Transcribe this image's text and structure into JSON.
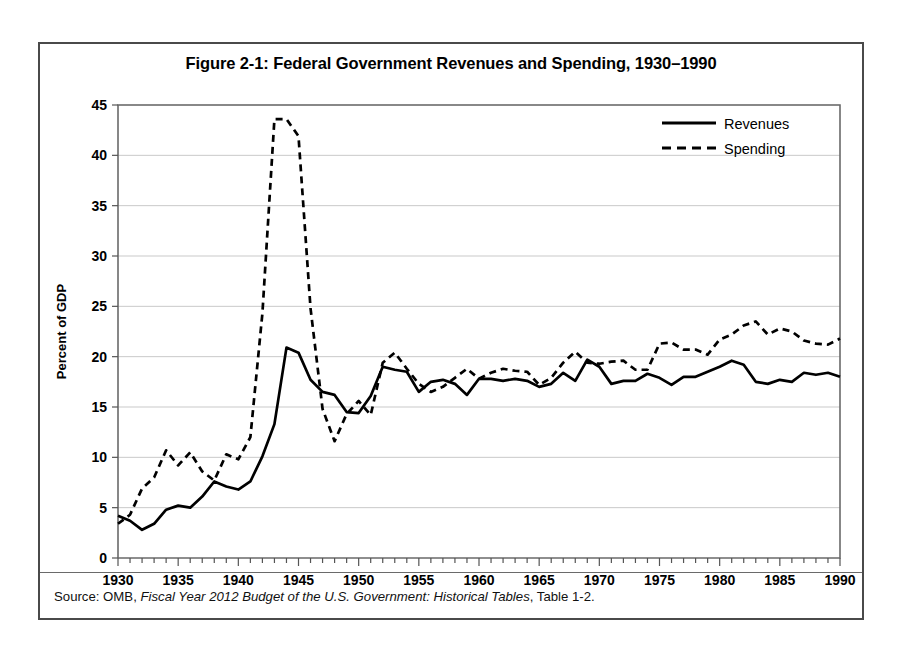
{
  "figure": {
    "title": "Figure 2-1: Federal Government Revenues and Spending, 1930–1990",
    "source_prefix": "Source: OMB, ",
    "source_italic": "Fiscal Year 2012 Budget of the U.S. Government: Historical Tables",
    "source_suffix": ", Table 1-2."
  },
  "legend": {
    "revenues_label": "Revenues",
    "spending_label": "Spending"
  },
  "chart_data": {
    "type": "line",
    "title": "Figure 2-1: Federal Government Revenues and Spending, 1930–1990",
    "xlabel": "",
    "ylabel": "Percent of GDP",
    "xlim": [
      1930,
      1990
    ],
    "ylim": [
      0,
      45
    ],
    "ytick_step": 5,
    "yticks": [
      0,
      5,
      10,
      15,
      20,
      25,
      30,
      35,
      40,
      45
    ],
    "xticks": [
      1930,
      1935,
      1940,
      1945,
      1950,
      1955,
      1960,
      1965,
      1970,
      1975,
      1980,
      1985,
      1990
    ],
    "xtick_minor_step": 1,
    "grid": "horizontal",
    "legend_position": "top-right",
    "x": [
      1930,
      1931,
      1932,
      1933,
      1934,
      1935,
      1936,
      1937,
      1938,
      1939,
      1940,
      1941,
      1942,
      1943,
      1944,
      1945,
      1946,
      1947,
      1948,
      1949,
      1950,
      1951,
      1952,
      1953,
      1954,
      1955,
      1956,
      1957,
      1958,
      1959,
      1960,
      1961,
      1962,
      1963,
      1964,
      1965,
      1966,
      1967,
      1968,
      1969,
      1970,
      1971,
      1972,
      1973,
      1974,
      1975,
      1976,
      1977,
      1978,
      1979,
      1980,
      1981,
      1982,
      1983,
      1984,
      1985,
      1986,
      1987,
      1988,
      1989,
      1990
    ],
    "series": [
      {
        "name": "Revenues",
        "style": "solid",
        "values": [
          4.2,
          3.7,
          2.8,
          3.4,
          4.8,
          5.2,
          5.0,
          6.1,
          7.6,
          7.1,
          6.8,
          7.6,
          10.1,
          13.3,
          20.9,
          20.4,
          17.7,
          16.5,
          16.2,
          14.5,
          14.4,
          16.1,
          19.0,
          18.7,
          18.5,
          16.5,
          17.5,
          17.7,
          17.3,
          16.2,
          17.8,
          17.8,
          17.6,
          17.8,
          17.6,
          17.0,
          17.3,
          18.4,
          17.6,
          19.7,
          19.0,
          17.3,
          17.6,
          17.6,
          18.3,
          17.9,
          17.2,
          18.0,
          18.0,
          18.5,
          19.0,
          19.6,
          19.2,
          17.5,
          17.3,
          17.7,
          17.5,
          18.4,
          18.2,
          18.4,
          18.0
        ]
      },
      {
        "name": "Spending",
        "style": "dashed",
        "values": [
          3.4,
          4.3,
          6.9,
          8.0,
          10.7,
          9.2,
          10.5,
          8.6,
          7.7,
          10.3,
          9.8,
          12.0,
          24.3,
          43.6,
          43.6,
          41.9,
          24.8,
          14.8,
          11.6,
          14.3,
          15.6,
          14.2,
          19.4,
          20.4,
          18.8,
          17.3,
          16.5,
          17.0,
          17.9,
          18.8,
          17.8,
          18.4,
          18.8,
          18.6,
          18.5,
          17.2,
          17.9,
          19.4,
          20.5,
          19.4,
          19.3,
          19.5,
          19.6,
          18.7,
          18.7,
          21.3,
          21.4,
          20.7,
          20.7,
          20.2,
          21.7,
          22.2,
          23.1,
          23.5,
          22.2,
          22.8,
          22.5,
          21.6,
          21.3,
          21.2,
          21.8
        ]
      }
    ]
  }
}
